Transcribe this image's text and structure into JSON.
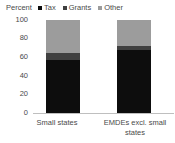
{
  "chart_data": {
    "type": "bar",
    "subtype": "stacked-100-percent",
    "title": "",
    "ylabel": "Percent",
    "xlabel": "",
    "categories": [
      "Small states",
      "EMDEs excl. small states"
    ],
    "series": [
      {
        "name": "Tax",
        "values": [
          57,
          68
        ],
        "color": "#0d0d0d"
      },
      {
        "name": "Grants",
        "values": [
          8,
          4
        ],
        "color": "#404040"
      },
      {
        "name": "Other",
        "values": [
          35,
          28
        ],
        "color": "#9c9c9c"
      }
    ],
    "ylim": [
      0,
      100
    ],
    "yticks": [
      0,
      20,
      40,
      60,
      80,
      100
    ],
    "ytick_labels": [
      "0",
      "20",
      "40",
      "60",
      "80",
      "100"
    ],
    "grid": false,
    "legend_position": "top",
    "stack_order": [
      "Tax",
      "Grants",
      "Other"
    ]
  },
  "axis": {
    "unit_label": "Percent",
    "ticks": [
      {
        "label": "100",
        "value": 100
      },
      {
        "label": "80",
        "value": 80
      },
      {
        "label": "60",
        "value": 60
      },
      {
        "label": "40",
        "value": 40
      },
      {
        "label": "20",
        "value": 20
      },
      {
        "label": "0",
        "value": 0
      }
    ]
  },
  "legend": {
    "items": [
      {
        "label": "Tax",
        "swatch": "#0d0d0d"
      },
      {
        "label": "Grants",
        "swatch": "#404040"
      },
      {
        "label": "Other",
        "swatch": "#9c9c9c"
      }
    ]
  },
  "categories": [
    {
      "label": "Small states"
    },
    {
      "label": "EMDEs excl. small states"
    }
  ]
}
